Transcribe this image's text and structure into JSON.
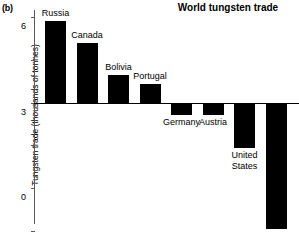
{
  "panel": {
    "letter": "(b)"
  },
  "chart_data": {
    "type": "bar",
    "title": "World tungsten trade",
    "xlabel": "",
    "ylabel": "Tungsten trade (thousands of tonnes)",
    "categories": [
      "Russia",
      "Canada",
      "Bolivia",
      "Portugal",
      "Germany",
      "Austria",
      "United States",
      "China"
    ],
    "values": [
      5.7,
      4.2,
      1.9,
      1.3,
      -0.9,
      -0.9,
      -3.2,
      -8.85
    ],
    "ylim": [
      -9,
      6
    ],
    "yticks": [
      6,
      3,
      0,
      -3,
      -6,
      -9
    ],
    "ytick_labels": [
      "6",
      "3",
      "0",
      "–3",
      "–6",
      "–9"
    ],
    "grid": false,
    "legend": null,
    "bar_color": "#000000",
    "axis_color": "#5a5a5a",
    "label_positions": [
      "above",
      "above",
      "above",
      "above",
      "below",
      "below",
      "below",
      "below"
    ]
  }
}
